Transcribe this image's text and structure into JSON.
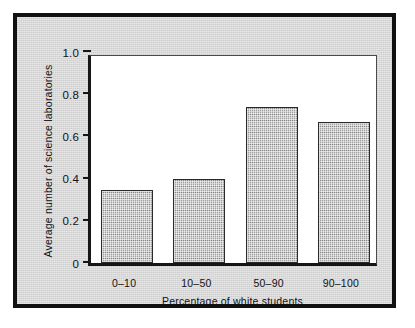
{
  "figure": {
    "background_color": "#d9d9d9",
    "frame_color": "#111111",
    "plot_background": "#ffffff",
    "bar_color": "#a2a2a2",
    "bar_edge_color": "#2a2a2a"
  },
  "chart_data": {
    "type": "bar",
    "title": "",
    "xlabel": "Percentage of white students",
    "ylabel": "Average number of science laboratories",
    "categories": [
      "0–10",
      "10–50",
      "50–90",
      "90–100"
    ],
    "values": [
      0.345,
      0.4,
      0.74,
      0.67
    ],
    "ylim": [
      0,
      1.0
    ],
    "yticks": [
      0,
      0.2,
      0.4,
      0.6,
      0.8,
      1.0
    ],
    "ytick_labels": [
      "0",
      "0.2",
      "0.4",
      "0.6",
      "0.8",
      "1.0"
    ],
    "grid": false,
    "legend": false,
    "legend_position": "none"
  }
}
